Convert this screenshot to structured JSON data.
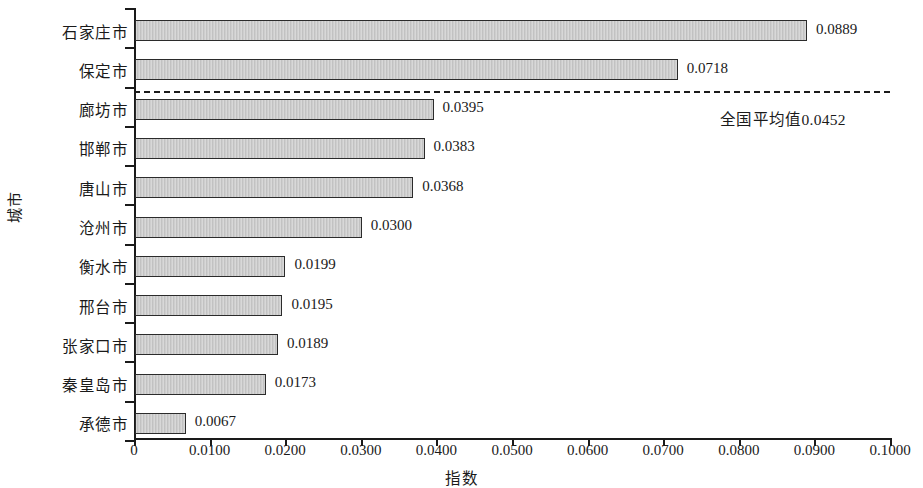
{
  "chart_data": {
    "type": "bar",
    "orientation": "horizontal",
    "title": "",
    "xlabel": "指数",
    "ylabel": "城市",
    "categories": [
      "石家庄市",
      "保定市",
      "廊坊市",
      "邯郸市",
      "唐山市",
      "沧州市",
      "衡水市",
      "邢台市",
      "张家口市",
      "秦皇岛市",
      "承德市"
    ],
    "values": [
      0.0889,
      0.0718,
      0.0395,
      0.0383,
      0.0368,
      0.03,
      0.0199,
      0.0195,
      0.0189,
      0.0173,
      0.0067
    ],
    "value_labels": [
      "0.0889",
      "0.0718",
      "0.0395",
      "0.0383",
      "0.0368",
      "0.0300",
      "0.0199",
      "0.0195",
      "0.0189",
      "0.0173",
      "0.0067"
    ],
    "xlim": [
      0,
      0.1
    ],
    "xticks": [
      0,
      0.01,
      0.02,
      0.03,
      0.04,
      0.05,
      0.06,
      0.07,
      0.08,
      0.09,
      0.1
    ],
    "xtick_labels": [
      "0",
      "0.0100",
      "0.0200",
      "0.0300",
      "0.0400",
      "0.0500",
      "0.0600",
      "0.0700",
      "0.0800",
      "0.0900",
      "0.1000"
    ],
    "grid": false,
    "legend": null,
    "annotations": [
      {
        "name": "national-average",
        "label": "全国平均值0.0452",
        "value": 0.0452,
        "style": "dashed-horizontal-line"
      }
    ],
    "colors": {
      "bar_fill": "#c9c9c9",
      "bar_border": "#2b2b2b",
      "axis": "#1a1a1a",
      "text": "#1a1a1a",
      "background": "#ffffff"
    }
  }
}
